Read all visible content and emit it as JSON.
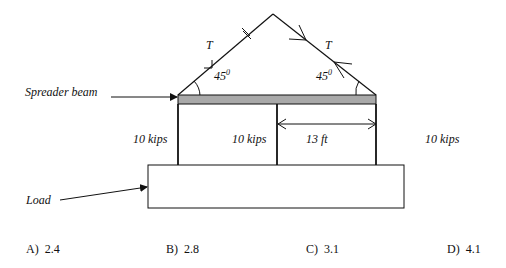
{
  "diagram": {
    "labels": {
      "spreader_beam": "Spreader beam",
      "load": "Load",
      "tension_left": "T",
      "tension_right": "T",
      "angle_left": "45",
      "angle_left_sup": "0",
      "angle_right": "45",
      "angle_right_sup": "0",
      "weight_left": "10 kips",
      "weight_middle": "10 kips",
      "weight_right": "10 kips",
      "dimension": "13 ft"
    },
    "colors": {
      "beam_fill": "#a9a9a9",
      "line": "#111111"
    }
  },
  "answers": [
    {
      "key": "A)",
      "value": "2.4"
    },
    {
      "key": "B)",
      "value": "2.8"
    },
    {
      "key": "C)",
      "value": "3.1"
    },
    {
      "key": "D)",
      "value": "4.1"
    }
  ]
}
